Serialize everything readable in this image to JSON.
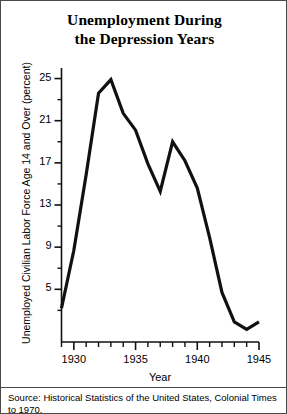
{
  "figure": {
    "title_line1": "Unemployment During",
    "title_line2": "the Depression Years",
    "source": "Source: Historical Statistics of the United States, Colonial Times to 1970."
  },
  "chart_data": {
    "type": "line",
    "title": "Unemployment During the Depression Years",
    "xlabel": "Year",
    "ylabel": "Unemployed Civilian Labor Force Age 14 and Over (percent)",
    "xlim": [
      1929,
      1945
    ],
    "ylim": [
      0,
      26
    ],
    "grid": false,
    "legend": null,
    "x_major_ticks": [
      1930,
      1935,
      1940,
      1945
    ],
    "x_minor_ticks": [
      1929,
      1931,
      1932,
      1933,
      1934,
      1936,
      1937,
      1938,
      1939,
      1941,
      1942,
      1943,
      1944
    ],
    "y_major_ticks": [
      5,
      9,
      13,
      17,
      21,
      25
    ],
    "y_minor_ticks": [
      3,
      7,
      11,
      15,
      19,
      23
    ],
    "line_color": "#111111",
    "x": [
      1929,
      1930,
      1931,
      1932,
      1933,
      1934,
      1935,
      1936,
      1937,
      1938,
      1939,
      1940,
      1941,
      1942,
      1943,
      1944,
      1945
    ],
    "values": [
      3.2,
      8.7,
      15.9,
      23.6,
      24.9,
      21.7,
      20.1,
      16.9,
      14.3,
      19.0,
      17.2,
      14.6,
      9.9,
      4.7,
      1.9,
      1.2,
      1.9
    ],
    "series": [
      {
        "name": "Unemployment rate (percent)",
        "values": [
          3.2,
          8.7,
          15.9,
          23.6,
          24.9,
          21.7,
          20.1,
          16.9,
          14.3,
          19.0,
          17.2,
          14.6,
          9.9,
          4.7,
          1.9,
          1.2,
          1.9
        ]
      }
    ]
  }
}
